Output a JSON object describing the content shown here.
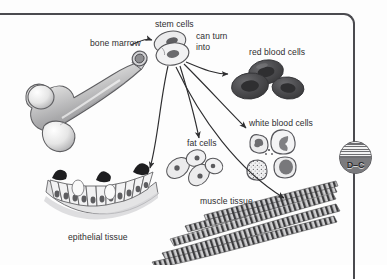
{
  "figure": {
    "domain": "biology-diagram",
    "palette": {
      "ink": "#2e2e30",
      "frame": "#4a4a4f",
      "background": "#fdfdfd",
      "badge_fill": "#8f8f92",
      "red_blood_cell": "#4a4a4c",
      "cell_outline": "#5a5a5c",
      "cell_fill": "#e9e9ea"
    }
  },
  "labels": {
    "bone_marrow": "bone marrow",
    "stem_cells": "stem cells",
    "can_turn_into": "can turn into",
    "red_blood_cells": "red blood cells",
    "white_blood_cells": "white blood cells",
    "fat_cells": "fat cells",
    "muscle_tissue": "muscle tissue",
    "epithelial_tissue": "epithelial tissue"
  },
  "badge": {
    "text": "D–C"
  },
  "structures": [
    {
      "name": "femur-bone",
      "label": "bone marrow"
    },
    {
      "name": "stem-cells",
      "label": "stem cells"
    },
    {
      "name": "red-blood-cells",
      "label": "red blood cells",
      "count": 3
    },
    {
      "name": "white-blood-cells",
      "label": "white blood cells",
      "count": 4
    },
    {
      "name": "fat-cells",
      "label": "fat cells",
      "count": 4
    },
    {
      "name": "muscle-tissue",
      "label": "muscle tissue"
    },
    {
      "name": "epithelial-tissue",
      "label": "epithelial tissue"
    }
  ],
  "arrows": [
    {
      "from": "bone marrow",
      "to": "stem cells"
    },
    {
      "from": "stem cells",
      "to": "red blood cells"
    },
    {
      "from": "stem cells",
      "to": "white blood cells"
    },
    {
      "from": "stem cells",
      "to": "fat cells"
    },
    {
      "from": "stem cells",
      "to": "muscle tissue"
    },
    {
      "from": "stem cells",
      "to": "epithelial tissue"
    }
  ]
}
